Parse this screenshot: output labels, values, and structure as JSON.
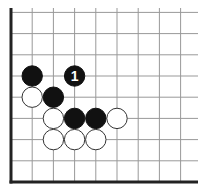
{
  "diagram": {
    "type": "go-board-corner",
    "grid": {
      "origin_x": 11,
      "origin_y": 182,
      "spacing": 21.2,
      "cols": 9,
      "rows": 9,
      "line_color": "#999999",
      "edge_color": "#222222"
    },
    "stones": [
      {
        "color": "black",
        "col": 1,
        "row": 5,
        "label": ""
      },
      {
        "color": "black",
        "col": 3,
        "row": 5,
        "label": "1"
      },
      {
        "color": "white",
        "col": 1,
        "row": 4,
        "label": ""
      },
      {
        "color": "black",
        "col": 2,
        "row": 4,
        "label": ""
      },
      {
        "color": "white",
        "col": 2,
        "row": 3,
        "label": ""
      },
      {
        "color": "black",
        "col": 3,
        "row": 3,
        "label": ""
      },
      {
        "color": "black",
        "col": 4,
        "row": 3,
        "label": ""
      },
      {
        "color": "white",
        "col": 5,
        "row": 3,
        "label": ""
      },
      {
        "color": "white",
        "col": 2,
        "row": 2,
        "label": ""
      },
      {
        "color": "white",
        "col": 3,
        "row": 2,
        "label": ""
      },
      {
        "color": "white",
        "col": 4,
        "row": 2,
        "label": ""
      }
    ],
    "move_marker": {
      "number": "1",
      "text_color": "#ffffff"
    },
    "colors": {
      "black_stone": "#111111",
      "white_stone": "#ffffff",
      "white_outline": "#333333"
    }
  }
}
